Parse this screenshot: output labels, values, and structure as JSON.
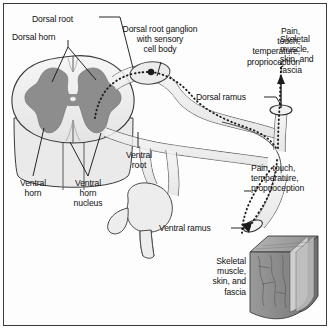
{
  "figure": {
    "domain": "anatomical-diagram",
    "frame_border_color": "#3b3b3b",
    "background_color": "#fdfdfd"
  },
  "colors": {
    "gray_matter": "#8d8d8d",
    "white_matter": "#ededed",
    "cord_outline": "#3a3a3a",
    "nerve_fill": "#f0f0f0",
    "nerve_outline": "#4a4a4a",
    "sensory_dotted": "#1c1c1c",
    "muscle_block_front": "#8f8f8f",
    "muscle_block_top": "#a8a8a8",
    "muscle_block_side": "#6f6f6f",
    "text": "#101010"
  },
  "labels": [
    {
      "id": "dorsal-root",
      "text": "Dorsal root",
      "x": 32,
      "y": 14,
      "align": "left",
      "width": 66
    },
    {
      "id": "dorsal-horn",
      "text": "Dorsal horn",
      "x": 12,
      "y": 36,
      "align": "left",
      "width": 72
    },
    {
      "id": "dorsal-root-ganglion",
      "text": "Dorsal root ganglion\nwith sensory\ncell body",
      "x": 112,
      "y": 30,
      "align": "center",
      "width": 98
    },
    {
      "id": "pain-touch-upper",
      "text": "Pain,\ntouch,\ntemperature,\nproprioception",
      "x": 222,
      "y": 30,
      "align": "right",
      "width": 78
    },
    {
      "id": "skeletal-upper",
      "text": "Skeletal\nmuscle,\nskin, and\nfascia",
      "x": 282,
      "y": 38,
      "align": "left",
      "width": 48
    },
    {
      "id": "dorsal-ramus",
      "text": "Dorsal ramus",
      "x": 196,
      "y": 94,
      "align": "left",
      "width": 66
    },
    {
      "id": "ventral-root",
      "text": "Ventral\nroot",
      "x": 114,
      "y": 150,
      "align": "center",
      "width": 50
    },
    {
      "id": "pain-touch-lower",
      "text": "Pain, touch,\ntemperature,\nproprioception",
      "x": 251,
      "y": 165,
      "align": "left",
      "width": 76
    },
    {
      "id": "ventral-horn",
      "text": "Ventral\nhorn",
      "x": 8,
      "y": 178,
      "align": "center",
      "width": 50
    },
    {
      "id": "ventral-horn-nucleus",
      "text": "Ventral\nhorn\nnucleus",
      "x": 62,
      "y": 178,
      "align": "center",
      "width": 52
    },
    {
      "id": "ventral-ramus",
      "text": "Ventral ramus",
      "x": 160,
      "y": 226,
      "align": "left",
      "width": 70
    },
    {
      "id": "skeletal-lower",
      "text": "Skeletal\nmuscle,\nskin, and\nfascia",
      "x": 188,
      "y": 258,
      "align": "right",
      "width": 58
    }
  ],
  "structures": [
    {
      "id": "spinal-cord",
      "name": "spinal-cord-cross-section"
    },
    {
      "id": "gray-matter",
      "name": "butterfly-gray-matter"
    },
    {
      "id": "dorsal-root-nerve",
      "name": "dorsal-root"
    },
    {
      "id": "ganglion",
      "name": "dorsal-root-ganglion"
    },
    {
      "id": "sensory-cell-body",
      "name": "sensory-cell-body-dot"
    },
    {
      "id": "ventral-root-nerve",
      "name": "ventral-root"
    },
    {
      "id": "spinal-nerve-trunk",
      "name": "spinal-nerve-trunk"
    },
    {
      "id": "dorsal-ramus-branch",
      "name": "dorsal-ramus-branch"
    },
    {
      "id": "ventral-ramus-branch",
      "name": "ventral-ramus-branch"
    },
    {
      "id": "sympathetic-ganglion",
      "name": "sympathetic-chain-ganglion"
    },
    {
      "id": "muscle-block",
      "name": "skeletal-muscle-block"
    },
    {
      "id": "sensory-pathway",
      "name": "dotted-sensory-pathway"
    }
  ]
}
